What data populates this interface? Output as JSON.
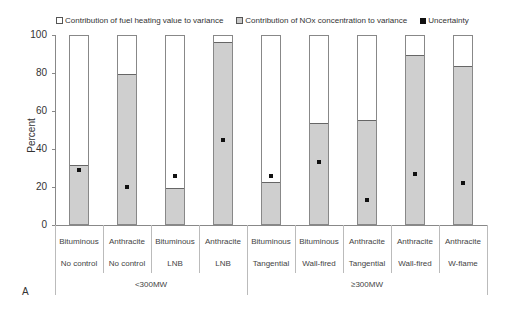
{
  "legend": {
    "fuel": "Contribution of fuel heating value to variance",
    "nox": "Contribution of NOx concentration to variance",
    "unc": "Uncertainty"
  },
  "panel_label": "A",
  "chart_data": {
    "type": "bar",
    "stacked": true,
    "title": "",
    "xlabel": "",
    "ylabel": "Percent",
    "ylim": [
      0,
      100
    ],
    "yticks": [
      0,
      20,
      40,
      60,
      80,
      100
    ],
    "categories": [
      {
        "fuel": "Bituminous",
        "burner": "No control",
        "group": "<300MW"
      },
      {
        "fuel": "Anthracite",
        "burner": "No control",
        "group": "<300MW"
      },
      {
        "fuel": "Bituminous",
        "burner": "LNB",
        "group": "<300MW"
      },
      {
        "fuel": "Anthracite",
        "burner": "LNB",
        "group": "<300MW"
      },
      {
        "fuel": "Bituminous",
        "burner": "Tangential",
        "group": "≥300MW"
      },
      {
        "fuel": "Bituminous",
        "burner": "Wall-fired",
        "group": "≥300MW"
      },
      {
        "fuel": "Anthracite",
        "burner": "Tangential",
        "group": "≥300MW"
      },
      {
        "fuel": "Anthracite",
        "burner": "Wall-fired",
        "group": "≥300MW"
      },
      {
        "fuel": "Anthracite",
        "burner": "W-flame",
        "group": "≥300MW"
      }
    ],
    "groups": [
      {
        "label": "<300MW",
        "start": 0,
        "count": 4
      },
      {
        "label": "≥300MW",
        "start": 4,
        "count": 5
      }
    ],
    "series": [
      {
        "name": "Contribution of NOx concentration to variance",
        "color": "#cfcfcf",
        "values": [
          31,
          79,
          19,
          96,
          22,
          53,
          55,
          89,
          83
        ]
      },
      {
        "name": "Contribution of fuel heating value to variance",
        "color": "#ffffff",
        "values": [
          69,
          21,
          81,
          4,
          78,
          47,
          45,
          11,
          17
        ]
      },
      {
        "name": "Uncertainty",
        "type": "marker",
        "color": "#111111",
        "values": [
          29,
          20,
          26,
          45,
          26,
          33,
          13,
          27,
          22
        ]
      }
    ],
    "legend_position": "top",
    "grid": false
  }
}
